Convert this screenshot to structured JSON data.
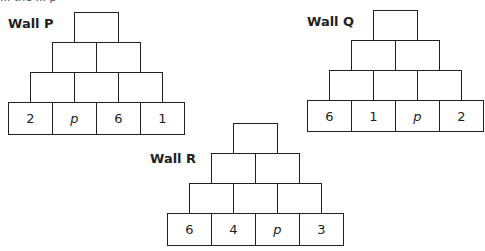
{
  "top_text_fragment": "... the ... p",
  "walls": [
    {
      "label": "Wall P",
      "bottom_row": [
        "2",
        "p",
        "6",
        "1"
      ],
      "rows_above": [
        [
          "",
          "",
          ""
        ],
        [
          "",
          ""
        ],
        [
          ""
        ]
      ]
    },
    {
      "label": "Wall Q",
      "bottom_row": [
        "6",
        "1",
        "p",
        "2"
      ],
      "rows_above": [
        [
          "",
          "",
          ""
        ],
        [
          "",
          ""
        ],
        [
          ""
        ]
      ]
    },
    {
      "label": "Wall R",
      "bottom_row": [
        "6",
        "4",
        "p",
        "3"
      ],
      "rows_above": [
        [
          "",
          "",
          ""
        ],
        [
          "",
          ""
        ],
        [
          ""
        ]
      ]
    }
  ]
}
